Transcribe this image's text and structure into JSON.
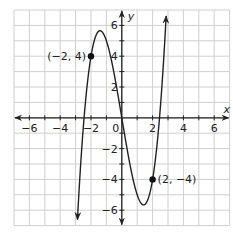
{
  "chart_data": {
    "type": "line",
    "title": "",
    "xlabel": "x",
    "ylabel": "y",
    "xlim": [
      -7,
      7
    ],
    "ylim": [
      -7,
      7
    ],
    "grid": true,
    "x_ticks": [
      -6,
      -4,
      -2,
      0,
      2,
      4,
      6
    ],
    "y_ticks": [
      -6,
      -4,
      -2,
      2,
      4,
      6
    ],
    "x_tick_labels": [
      "−6",
      "−4",
      "−2",
      "0",
      "2",
      "4",
      "6"
    ],
    "y_tick_labels": [
      "−6",
      "−4",
      "−2",
      "2",
      "4",
      "6"
    ],
    "series": [
      {
        "name": "f(x) = x^3 - 6x",
        "function": "x^3 - 6x",
        "x_range": [
          -2.88,
          2.88
        ]
      }
    ],
    "points": [
      {
        "x": -2,
        "y": 4,
        "label": "(−2, 4)"
      },
      {
        "x": 2,
        "y": -4,
        "label": "(2, −4)"
      }
    ],
    "annotations": [
      "(−2, 4)",
      "(2, −4)"
    ]
  },
  "labels": {
    "x_axis": "x",
    "y_axis": "y",
    "origin": "0",
    "point1": "(−2, 4)",
    "point2": "(2, −4)"
  }
}
